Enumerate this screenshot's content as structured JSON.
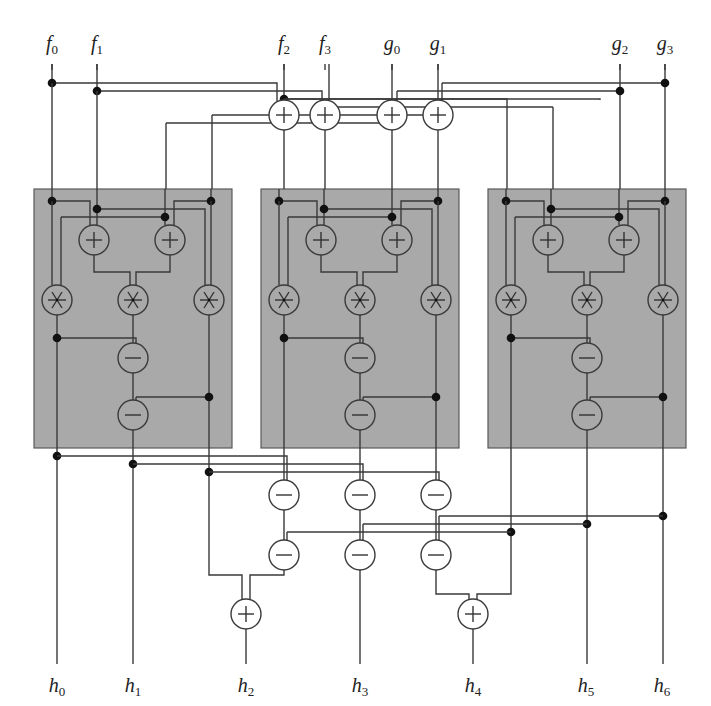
{
  "inputs_top": [
    {
      "id": "f0",
      "base": "f",
      "sub": "0",
      "x": 52
    },
    {
      "id": "f1",
      "base": "f",
      "sub": "1",
      "x": 97
    },
    {
      "id": "f2",
      "base": "f",
      "sub": "2",
      "x": 284
    },
    {
      "id": "f3",
      "base": "f",
      "sub": "3",
      "x": 325
    },
    {
      "id": "g0",
      "base": "g",
      "sub": "0",
      "x": 392
    },
    {
      "id": "g1",
      "base": "g",
      "sub": "1",
      "x": 438
    },
    {
      "id": "g2",
      "base": "g",
      "sub": "2",
      "x": 620
    },
    {
      "id": "g3",
      "base": "g",
      "sub": "3",
      "x": 665
    }
  ],
  "outputs_bottom": [
    {
      "id": "h0",
      "base": "h",
      "sub": "0",
      "x": 57
    },
    {
      "id": "h1",
      "base": "h",
      "sub": "1",
      "x": 133
    },
    {
      "id": "h2",
      "base": "h",
      "sub": "2",
      "x": 246
    },
    {
      "id": "h3",
      "base": "h",
      "sub": "3",
      "x": 360
    },
    {
      "id": "h4",
      "base": "h",
      "sub": "4",
      "x": 473
    },
    {
      "id": "h5",
      "base": "h",
      "sub": "5",
      "x": 586
    },
    {
      "id": "h6",
      "base": "h",
      "sub": "6",
      "x": 662
    }
  ],
  "operators": {
    "add": "+",
    "sub": "−",
    "mul": "∗"
  },
  "blocks": [
    {
      "name": "block-low",
      "x": 34,
      "y": 189,
      "w": 198,
      "h": 259
    },
    {
      "name": "block-middle",
      "x": 261,
      "y": 189,
      "w": 198,
      "h": 259
    },
    {
      "name": "block-high",
      "x": 488,
      "y": 189,
      "w": 198,
      "h": 259
    }
  ],
  "colors": {
    "block_fill": "#a9a9a9",
    "wire": "#3a3a3a",
    "node": "#111111"
  }
}
